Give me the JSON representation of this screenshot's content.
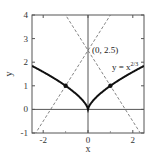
{
  "chart_data": {
    "type": "line",
    "title": "",
    "xlabel": "x",
    "ylabel": "y",
    "xlim": [
      -2.5,
      2.5
    ],
    "ylim": [
      -1,
      4
    ],
    "xticks": [
      -2,
      0,
      2
    ],
    "xtick_labels": [
      "-2",
      "0",
      "2"
    ],
    "yticks": [
      -1,
      0,
      1,
      2,
      3,
      4
    ],
    "ytick_labels": [
      "-1",
      "0",
      "1",
      "2",
      "3",
      "4"
    ],
    "grid": false,
    "series": [
      {
        "name": "y = x^(2/3)",
        "style": "solid-thick",
        "function": "x^(2/3)",
        "x": [
          -2.5,
          -2,
          -1.5,
          -1,
          -0.5,
          -0.1,
          0,
          0.1,
          0.5,
          1,
          1.5,
          2,
          2.5
        ],
        "y": [
          1.84,
          1.59,
          1.31,
          1.0,
          0.63,
          0.22,
          0,
          0.22,
          0.63,
          1.0,
          1.31,
          1.59,
          1.84
        ]
      },
      {
        "name": "normal line at x=1",
        "style": "dashed",
        "slope": -1.5,
        "intercept": 2.5
      },
      {
        "name": "normal line at x=-1",
        "style": "dashed",
        "slope": 1.5,
        "intercept": 2.5
      }
    ],
    "points": [
      {
        "x": -1,
        "y": 1
      },
      {
        "x": 1,
        "y": 1
      }
    ],
    "annotations": [
      {
        "text": "(0, 2.5)",
        "x": 0,
        "y": 2.5
      },
      {
        "text": "y = x",
        "superscript": "2/3",
        "x": 1.5,
        "y": 2.0
      }
    ]
  },
  "labels": {
    "x_axis": "x",
    "y_axis": "y",
    "point_annotation": "(0, 2.5)",
    "curve_label_base": "y = x",
    "curve_label_exp": "2/3"
  }
}
